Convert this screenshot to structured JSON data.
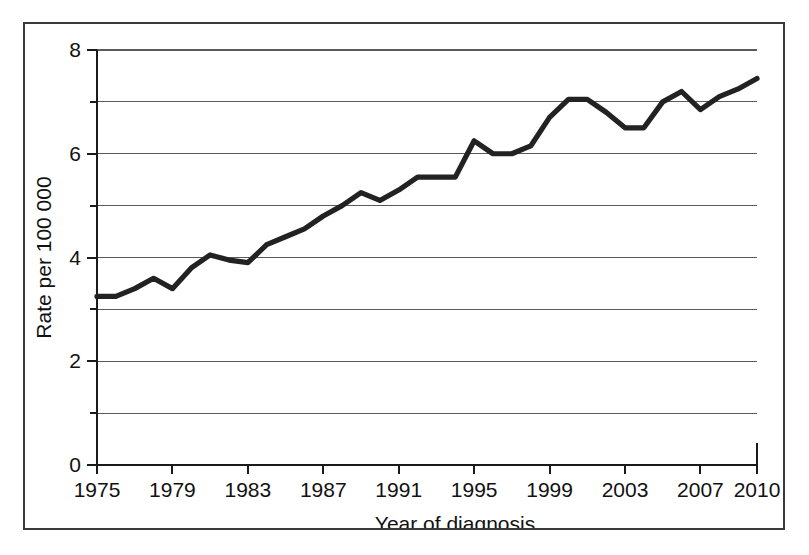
{
  "figure": {
    "background_color": "#ffffff",
    "frame_color": "#3a3a3c",
    "line_color": "#222222",
    "grid_color": "#5a5a5c"
  },
  "chart_data": {
    "type": "line",
    "title": "",
    "xlabel": "Year of diagnosis",
    "ylabel": "Rate per 100 000",
    "xlim": [
      1975,
      2010
    ],
    "ylim": [
      0,
      8
    ],
    "grid": true,
    "legend": "none",
    "x_major_ticks": [
      1975,
      1979,
      1983,
      1987,
      1991,
      1995,
      1999,
      2003,
      2007,
      2010
    ],
    "x_tick_labels": [
      "1975",
      "1979",
      "1983",
      "1987",
      "1991",
      "1995",
      "1999",
      "2003",
      "2007",
      "2010"
    ],
    "y_major_ticks": [
      0,
      2,
      4,
      6,
      8
    ],
    "y_tick_labels": [
      "0",
      "2",
      "4",
      "6",
      "8"
    ],
    "y_minor_gridlines": [
      1,
      3,
      5,
      7
    ],
    "x": [
      1975,
      1976,
      1977,
      1978,
      1979,
      1980,
      1981,
      1982,
      1983,
      1984,
      1985,
      1986,
      1987,
      1988,
      1989,
      1990,
      1991,
      1992,
      1993,
      1994,
      1995,
      1996,
      1997,
      1998,
      1999,
      2000,
      2001,
      2002,
      2003,
      2004,
      2005,
      2006,
      2007,
      2008,
      2009,
      2010
    ],
    "values": [
      3.25,
      3.25,
      3.4,
      3.6,
      3.4,
      3.8,
      4.05,
      3.95,
      3.9,
      4.25,
      4.4,
      4.55,
      4.8,
      5.0,
      5.25,
      5.1,
      5.3,
      5.55,
      5.55,
      5.55,
      6.25,
      6.0,
      6.0,
      6.15,
      6.7,
      7.05,
      7.05,
      6.8,
      6.5,
      6.5,
      7.0,
      7.2,
      6.85,
      7.1,
      7.25,
      7.45
    ],
    "series": [
      {
        "name": "Rate per 100 000",
        "values": [
          3.25,
          3.25,
          3.4,
          3.6,
          3.4,
          3.8,
          4.05,
          3.95,
          3.9,
          4.25,
          4.4,
          4.55,
          4.8,
          5.0,
          5.25,
          5.1,
          5.3,
          5.55,
          5.55,
          5.55,
          6.25,
          6.0,
          6.0,
          6.15,
          6.7,
          7.05,
          7.05,
          6.8,
          6.5,
          6.5,
          7.0,
          7.2,
          6.85,
          7.1,
          7.25,
          7.45
        ]
      }
    ]
  }
}
